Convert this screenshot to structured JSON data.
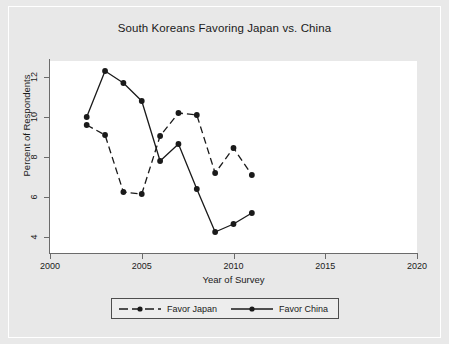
{
  "chart_data": {
    "type": "line",
    "title": "South Koreans Favoring Japan vs. China",
    "xlabel": "Year of Survey",
    "ylabel": "Percent of Respondents",
    "xlim": [
      2000,
      2020
    ],
    "ylim": [
      3.2,
      12.8
    ],
    "xticks": [
      "2000",
      "2005",
      "2010",
      "2015",
      "2020"
    ],
    "xtick_values": [
      2000,
      2005,
      2010,
      2015,
      2020
    ],
    "yticks": [
      "4",
      "6",
      "8",
      "10",
      "12"
    ],
    "ytick_values": [
      4,
      6,
      8,
      10,
      12
    ],
    "grid": false,
    "legend_position": "bottom",
    "x": [
      2002,
      2003,
      2004,
      2005,
      2006,
      2007,
      2008,
      2009,
      2010,
      2011
    ],
    "series": [
      {
        "name": "Favor Japan",
        "style": "dashed",
        "color": "#1a1a1a",
        "marker": "circle",
        "values": [
          9.6,
          9.1,
          6.25,
          6.15,
          9.05,
          10.2,
          10.1,
          7.2,
          8.45,
          7.1
        ]
      },
      {
        "name": "Favor China",
        "style": "solid",
        "color": "#1a1a1a",
        "marker": "circle",
        "values": [
          10.0,
          12.3,
          11.7,
          10.8,
          7.8,
          8.65,
          6.4,
          4.25,
          4.65,
          5.2
        ]
      }
    ]
  },
  "legend": {
    "items": [
      {
        "label": "Favor Japan"
      },
      {
        "label": "Favor China"
      }
    ]
  },
  "colors": {
    "line": "#1a1a1a",
    "axis": "#6b6b6b",
    "plot_background": "#ffffff",
    "figure_background": "#e8e8e8",
    "page_background": "#f2f2f2"
  }
}
